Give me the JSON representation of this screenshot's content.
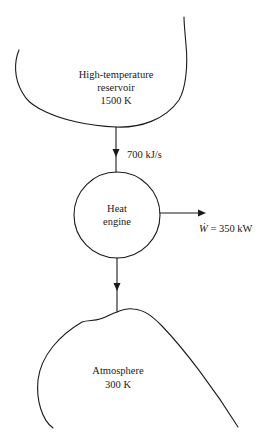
{
  "diagram": {
    "type": "heat-engine-schematic",
    "high_reservoir": {
      "name": "High-temperature",
      "name_line2": "reservoir",
      "temperature": "1500 K"
    },
    "heat_input": {
      "label": "700 kJ/s"
    },
    "engine": {
      "line1": "Heat",
      "line2": "engine"
    },
    "work_output": {
      "symbol": "Ẇ",
      "rest": " = 350 kW"
    },
    "low_reservoir": {
      "name": "Atmosphere",
      "temperature": "300 K"
    }
  }
}
